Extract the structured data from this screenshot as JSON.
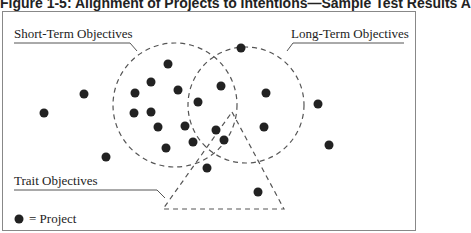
{
  "title": "Figure 1-5: Alignment of Projects to Intentions—Sample Test Results A",
  "labels": {
    "short_term": "Short-Term Objectives",
    "long_term": "Long-Term Objectives",
    "trait": "Trait Objectives",
    "legend": "= Project"
  },
  "colors": {
    "dot": "#222222",
    "dash": "#555555"
  },
  "projects": [
    [
      44,
      113
    ],
    [
      84,
      94
    ],
    [
      106,
      157
    ],
    [
      168,
      64
    ],
    [
      151,
      82
    ],
    [
      135,
      93
    ],
    [
      178,
      90
    ],
    [
      134,
      113
    ],
    [
      151,
      112
    ],
    [
      158,
      127
    ],
    [
      185,
      126
    ],
    [
      166,
      148
    ],
    [
      198,
      102
    ],
    [
      221,
      86
    ],
    [
      241,
      48
    ],
    [
      266,
      93
    ],
    [
      264,
      127
    ],
    [
      216,
      130
    ],
    [
      224,
      140
    ],
    [
      193,
      142
    ],
    [
      207,
      168
    ],
    [
      258,
      192
    ],
    [
      318,
      104
    ],
    [
      329,
      145
    ]
  ]
}
